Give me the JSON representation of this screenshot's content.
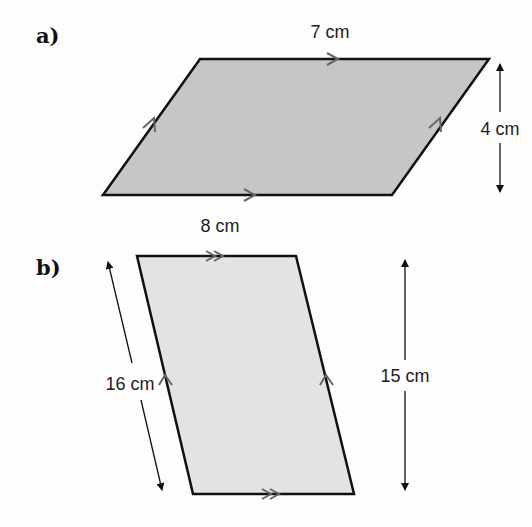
{
  "figure_a": {
    "label": "a)",
    "top_side": "7 cm",
    "bottom_side": "8 cm",
    "height": "4 cm",
    "fill": "#c6c6c6",
    "stroke": "#111111",
    "parallel_mark": "single-arrow"
  },
  "figure_b": {
    "label": "b)",
    "slanted_side": "16 cm",
    "height": "15 cm",
    "fill": "#e3e3e3",
    "stroke": "#111111",
    "parallel_mark_horizontal": "double-arrow",
    "parallel_mark_slanted": "single-arrow"
  },
  "colors": {
    "mark": "#666666",
    "arrow": "#111111"
  }
}
